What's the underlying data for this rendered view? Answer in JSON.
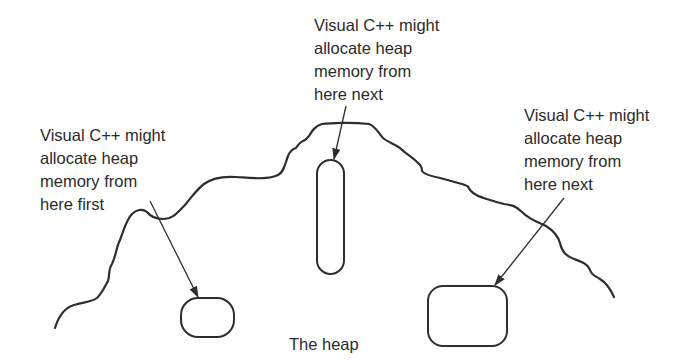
{
  "diagram": {
    "caption": "The heap",
    "colors": {
      "stroke": "#2e2e2e",
      "text": "#2b2b2b",
      "background": "#ffffff"
    },
    "annotations": [
      {
        "id": "first",
        "lines": [
          "Visual C++ might",
          "allocate heap",
          "memory from",
          "here first"
        ],
        "points_to": "small-block"
      },
      {
        "id": "next-middle",
        "lines": [
          "Visual C++ might",
          "allocate heap",
          "memory from",
          "here next"
        ],
        "points_to": "tall-block"
      },
      {
        "id": "next-right",
        "lines": [
          "Visual C++ might",
          "allocate heap",
          "memory from",
          "here next"
        ],
        "points_to": "wide-block"
      }
    ],
    "blocks": [
      "small-block",
      "tall-block",
      "wide-block"
    ]
  }
}
